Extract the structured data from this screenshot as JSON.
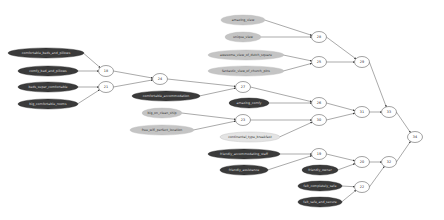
{
  "diagram": {
    "type": "directed-graph",
    "leaf_nodes": [
      {
        "id": "l1",
        "label": "comfortable_beds_and_pillows",
        "style": "dark",
        "cx": 46,
        "cy": 53,
        "rx": 38,
        "ry": 5
      },
      {
        "id": "l2",
        "label": "comfy_bed_and_pillows",
        "style": "dark",
        "cx": 48,
        "cy": 71,
        "rx": 30,
        "ry": 5
      },
      {
        "id": "l3",
        "label": "beds_super_comfortable",
        "style": "dark",
        "cx": 48,
        "cy": 87,
        "rx": 30,
        "ry": 5
      },
      {
        "id": "l4",
        "label": "big_comfortable_rooms",
        "style": "dark",
        "cx": 48,
        "cy": 104,
        "rx": 30,
        "ry": 5
      },
      {
        "id": "l5",
        "label": "amazing_view",
        "style": "light",
        "cx": 243,
        "cy": 20,
        "rx": 22,
        "ry": 5
      },
      {
        "id": "l6",
        "label": "unique_view",
        "style": "light",
        "cx": 243,
        "cy": 37,
        "rx": 18,
        "ry": 5
      },
      {
        "id": "l7",
        "label": "awesome_view_of_dutch_square",
        "style": "light",
        "cx": 246,
        "cy": 55,
        "rx": 38,
        "ry": 5
      },
      {
        "id": "l8",
        "label": "fantastic_view_of_church_pins",
        "style": "light",
        "cx": 246,
        "cy": 71,
        "rx": 38,
        "ry": 5
      },
      {
        "id": "l9",
        "label": "comfortable_accommodation",
        "style": "dark",
        "cx": 166,
        "cy": 96,
        "rx": 34,
        "ry": 5
      },
      {
        "id": "l10",
        "label": "amazing_comfy",
        "style": "dark",
        "cx": 249,
        "cy": 103,
        "rx": 20,
        "ry": 5
      },
      {
        "id": "l11",
        "label": "big_on_clean_ship",
        "style": "light",
        "cx": 162,
        "cy": 113,
        "rx": 20,
        "ry": 5
      },
      {
        "id": "l12",
        "label": "free_wifi_perfect_location",
        "style": "light",
        "cx": 162,
        "cy": 130,
        "rx": 32,
        "ry": 5
      },
      {
        "id": "l13",
        "label": "continental_type_breakfast",
        "style": "faint",
        "cx": 250,
        "cy": 137,
        "rx": 30,
        "ry": 5
      },
      {
        "id": "l14",
        "label": "friendly_accommodating_staff",
        "style": "dark",
        "cx": 244,
        "cy": 154,
        "rx": 36,
        "ry": 5
      },
      {
        "id": "l15",
        "label": "friendly_assistance",
        "style": "dark",
        "cx": 244,
        "cy": 170,
        "rx": 24,
        "ry": 5
      },
      {
        "id": "l16",
        "label": "friendly_owner",
        "style": "dark",
        "cx": 320,
        "cy": 170,
        "rx": 18,
        "ry": 5
      },
      {
        "id": "l17",
        "label": "felt_completely_safe",
        "style": "dark",
        "cx": 320,
        "cy": 186,
        "rx": 22,
        "ry": 5
      },
      {
        "id": "l18",
        "label": "felt_safe_and_secure",
        "style": "dark",
        "cx": 320,
        "cy": 202,
        "rx": 22,
        "ry": 5
      }
    ],
    "cluster_nodes": [
      {
        "id": "n18",
        "label": "18",
        "cx": 106,
        "cy": 71
      },
      {
        "id": "n21",
        "label": "21",
        "cx": 106,
        "cy": 87
      },
      {
        "id": "n24",
        "label": "24",
        "cx": 160,
        "cy": 79
      },
      {
        "id": "n27",
        "label": "27",
        "cx": 243,
        "cy": 87
      },
      {
        "id": "n28",
        "label": "28",
        "cx": 319,
        "cy": 37
      },
      {
        "id": "n25",
        "label": "25",
        "cx": 319,
        "cy": 62
      },
      {
        "id": "n29",
        "label": "29",
        "cx": 362,
        "cy": 62
      },
      {
        "id": "n26",
        "label": "26",
        "cx": 319,
        "cy": 103
      },
      {
        "id": "n23",
        "label": "23",
        "cx": 243,
        "cy": 120
      },
      {
        "id": "n30",
        "label": "30",
        "cx": 319,
        "cy": 120
      },
      {
        "id": "n31",
        "label": "31",
        "cx": 362,
        "cy": 112
      },
      {
        "id": "n33",
        "label": "33",
        "cx": 389,
        "cy": 112
      },
      {
        "id": "n19",
        "label": "19",
        "cx": 319,
        "cy": 154
      },
      {
        "id": "n20",
        "label": "20",
        "cx": 362,
        "cy": 162
      },
      {
        "id": "n32",
        "label": "32",
        "cx": 389,
        "cy": 162
      },
      {
        "id": "n22",
        "label": "22",
        "cx": 362,
        "cy": 187
      },
      {
        "id": "n34",
        "label": "34",
        "cx": 415,
        "cy": 137
      }
    ],
    "edges": [
      [
        "l1",
        "n18"
      ],
      [
        "l2",
        "n18"
      ],
      [
        "l3",
        "n21"
      ],
      [
        "l4",
        "n21"
      ],
      [
        "n18",
        "n24"
      ],
      [
        "n21",
        "n24"
      ],
      [
        "n24",
        "n27"
      ],
      [
        "l9",
        "n27"
      ],
      [
        "l5",
        "n28"
      ],
      [
        "l6",
        "n28"
      ],
      [
        "l7",
        "n25"
      ],
      [
        "l8",
        "n25"
      ],
      [
        "n28",
        "n29"
      ],
      [
        "n25",
        "n29"
      ],
      [
        "n27",
        "n26"
      ],
      [
        "l10",
        "n26"
      ],
      [
        "l11",
        "n23"
      ],
      [
        "l12",
        "n23"
      ],
      [
        "n23",
        "n30"
      ],
      [
        "l13",
        "n30"
      ],
      [
        "n26",
        "n31"
      ],
      [
        "n30",
        "n31"
      ],
      [
        "n31",
        "n33"
      ],
      [
        "n29",
        "n33"
      ],
      [
        "l14",
        "n19"
      ],
      [
        "l15",
        "n19"
      ],
      [
        "n19",
        "n20"
      ],
      [
        "l16",
        "n20"
      ],
      [
        "l17",
        "n22"
      ],
      [
        "l18",
        "n22"
      ],
      [
        "n20",
        "n32"
      ],
      [
        "n22",
        "n32"
      ],
      [
        "n33",
        "n34"
      ],
      [
        "n32",
        "n34"
      ]
    ],
    "colors": {
      "dark": "#3a3a3a",
      "light": "#c4c4c4",
      "faint": "#e4e4e4",
      "edge": "#555555",
      "cluster_stroke": "#444444"
    }
  }
}
